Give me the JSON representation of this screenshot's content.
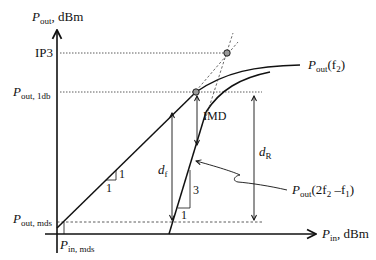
{
  "diagram": {
    "type": "amplifier-linearity-dynamic-range",
    "y_axis": {
      "symbol": "P",
      "subscript": "out",
      "unit": ", dBm"
    },
    "x_axis": {
      "symbol": "P",
      "subscript": "in",
      "unit": ", dBm"
    },
    "y_levels": {
      "ip3": "IP3",
      "p1db": {
        "symbol": "P",
        "subscript": "out, 1db"
      },
      "pmds": {
        "symbol": "P",
        "subscript": "out, mds"
      }
    },
    "x_levels": {
      "pin_mds": {
        "symbol": "P",
        "subscript": "in, mds"
      }
    },
    "curves": {
      "fundamental": {
        "symbol": "P",
        "subscript": "out",
        "arg": "(f",
        "arg_sub": "2",
        "arg_end": ")"
      },
      "im3": {
        "symbol": "P",
        "subscript": "out",
        "arg": "(2f",
        "arg_sub": "2",
        "arg_mid": " –f",
        "arg_sub2": "1",
        "arg_end": ")"
      }
    },
    "slope_fundamental": {
      "rise": "1",
      "run": "1"
    },
    "slope_im3": {
      "rise": "3",
      "run": "1"
    },
    "annotations": {
      "imd": "IMD",
      "df": {
        "symbol": "d",
        "subscript": "f"
      },
      "dr": {
        "symbol": "d",
        "subscript": "R"
      }
    }
  }
}
